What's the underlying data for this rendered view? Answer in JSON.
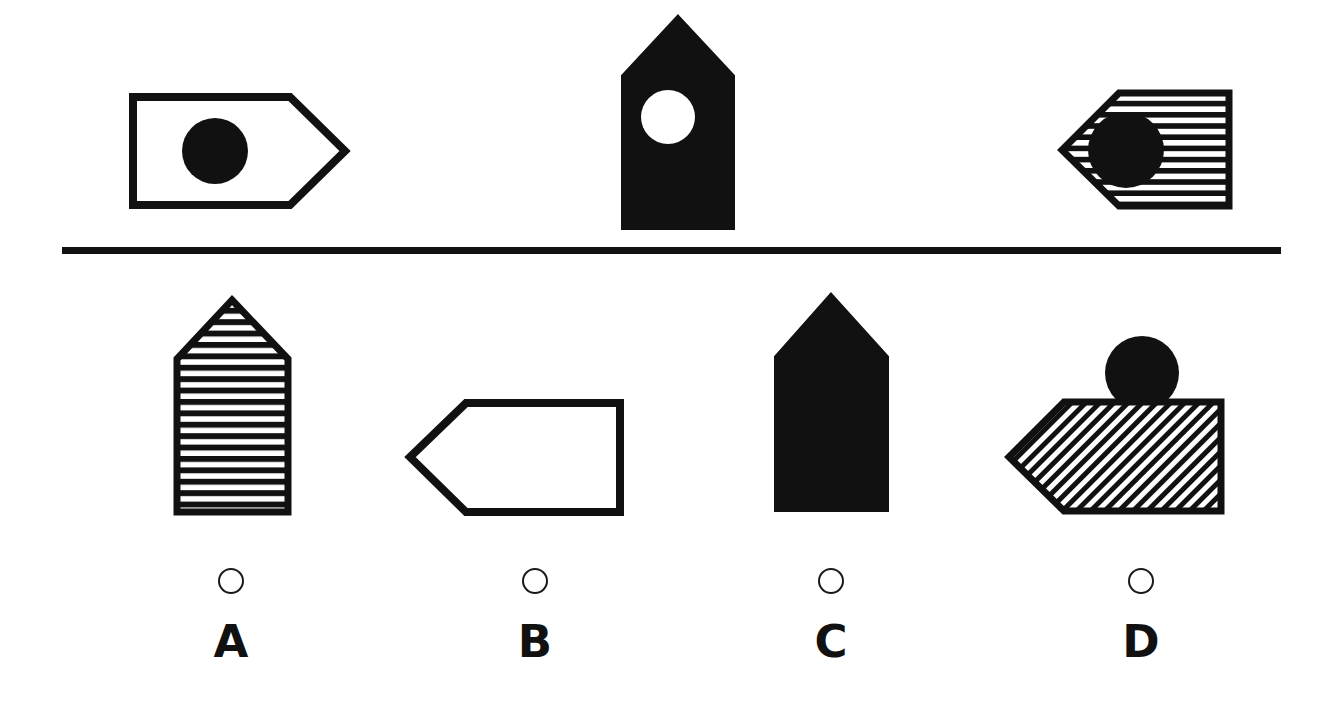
{
  "page": {
    "kind": "visual-analogy-multiple-choice",
    "background_color": "#ffffff",
    "ink_color": "#111111",
    "width": 1331,
    "height": 720
  },
  "divider": {
    "name": "horizontal-rule",
    "x": 62,
    "y": 247,
    "width": 1219,
    "thickness": 7,
    "color": "#111111"
  },
  "problem_row": {
    "label": "problem-shapes",
    "shapes": [
      {
        "id": "problem-shape-1",
        "figure": "pennant-right",
        "fill": "white",
        "outline": "#111111",
        "inner": "black-circle",
        "orientation": "points-right"
      },
      {
        "id": "problem-shape-2",
        "figure": "house-up",
        "fill": "black",
        "outline": "#111111",
        "inner": "white-circle",
        "orientation": "points-up"
      },
      {
        "id": "problem-shape-3",
        "figure": "pennant-left",
        "fill": "horizontal-stripes",
        "outline": "#111111",
        "inner": "black-circle",
        "orientation": "points-left"
      }
    ]
  },
  "options_row": {
    "label": "answer-options",
    "options": [
      {
        "id": "option-a",
        "letter": "A",
        "figure": "house-up",
        "fill": "horizontal-stripes",
        "outline": "#111111",
        "inner": "none",
        "orientation": "points-up",
        "selected": false
      },
      {
        "id": "option-b",
        "letter": "B",
        "figure": "pennant-left",
        "fill": "white",
        "outline": "#111111",
        "inner": "none",
        "orientation": "points-left",
        "selected": false
      },
      {
        "id": "option-c",
        "letter": "C",
        "figure": "house-up",
        "fill": "black",
        "outline": "#111111",
        "inner": "none",
        "orientation": "points-up",
        "selected": false
      },
      {
        "id": "option-d",
        "letter": "D",
        "figure": "pennant-left",
        "fill": "diagonal-hatch",
        "outline": "#111111",
        "inner": "black-circle-on-top",
        "orientation": "points-left",
        "selected": false
      }
    ]
  },
  "answer_controls": {
    "label": "answer-radio-row",
    "items": [
      {
        "id": "radio-a",
        "letter": "A",
        "checked": false
      },
      {
        "id": "radio-b",
        "letter": "B",
        "checked": false
      },
      {
        "id": "radio-c",
        "letter": "C",
        "checked": false
      },
      {
        "id": "radio-d",
        "letter": "D",
        "checked": false
      }
    ]
  }
}
